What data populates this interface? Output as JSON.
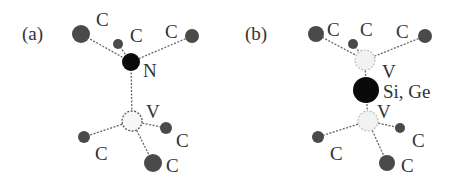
{
  "panels": [
    {
      "label": "(a)",
      "center_label": "N",
      "vacancy_label": "V",
      "carbon_label": "C"
    },
    {
      "label": "(b)",
      "center_label": "Si, Ge",
      "vacancy_top_label": "V",
      "vacancy_bottom_label": "V",
      "carbon_label": "C"
    }
  ],
  "colors": {
    "carbon": "#4a4a4a",
    "impurity": "#0a0a0a",
    "vacancy_fill": "#f2f2f2",
    "bond": "#666666"
  }
}
